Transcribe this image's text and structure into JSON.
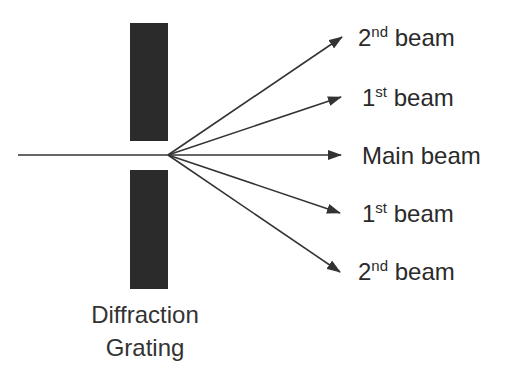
{
  "diagram": {
    "colors": {
      "grating": "#2b2b2b",
      "line": "#333333",
      "text": "#2a2a2a"
    },
    "grating": {
      "caption_line1": "Diffraction",
      "caption_line2": "Grating"
    },
    "incident": {
      "from": [
        18,
        155
      ],
      "to": [
        168,
        155
      ]
    },
    "beams": [
      {
        "id": "upper-2nd",
        "order": "2",
        "suffix": "nd",
        "word": "beam",
        "tip": [
          342,
          37
        ]
      },
      {
        "id": "upper-1st",
        "order": "1",
        "suffix": "st",
        "word": "beam",
        "tip": [
          341,
          97
        ]
      },
      {
        "id": "main",
        "order": "",
        "suffix": "",
        "word": "Main beam",
        "tip": [
          341,
          155
        ]
      },
      {
        "id": "lower-1st",
        "order": "1",
        "suffix": "st",
        "word": "beam",
        "tip": [
          340,
          213
        ]
      },
      {
        "id": "lower-2nd",
        "order": "2",
        "suffix": "nd",
        "word": "beam",
        "tip": [
          340,
          272
        ]
      }
    ]
  }
}
